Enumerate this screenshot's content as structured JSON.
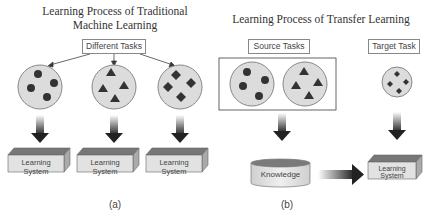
{
  "panel_a": {
    "title_line1": "Learning Process of Traditional",
    "title_line2": "Machine Learning",
    "tasks_label": "Different Tasks",
    "task_groups": [
      {
        "shape": "circle",
        "count": 4
      },
      {
        "shape": "triangle",
        "count": 4
      },
      {
        "shape": "diamond",
        "count": 4
      }
    ],
    "learning_systems": [
      "Learning System",
      "Learning System",
      "Learning System"
    ],
    "caption": "(a)"
  },
  "panel_b": {
    "title": "Learning Process of Transfer Learning",
    "source_label": "Source Tasks",
    "target_label": "Target Task",
    "source_groups": [
      {
        "shape": "circle",
        "count": 4
      },
      {
        "shape": "triangle",
        "count": 4
      }
    ],
    "target_group": {
      "shape": "diamond",
      "count": 4
    },
    "knowledge_label": "Knowledge",
    "learning_system": "Learning System",
    "caption": "(b)"
  },
  "colors": {
    "circle_fill": "#dcdcdc",
    "shape_fill": "#333333",
    "box_front": "#e2e2e2",
    "box_top": "#777777",
    "arrow_dark": "#222222"
  }
}
